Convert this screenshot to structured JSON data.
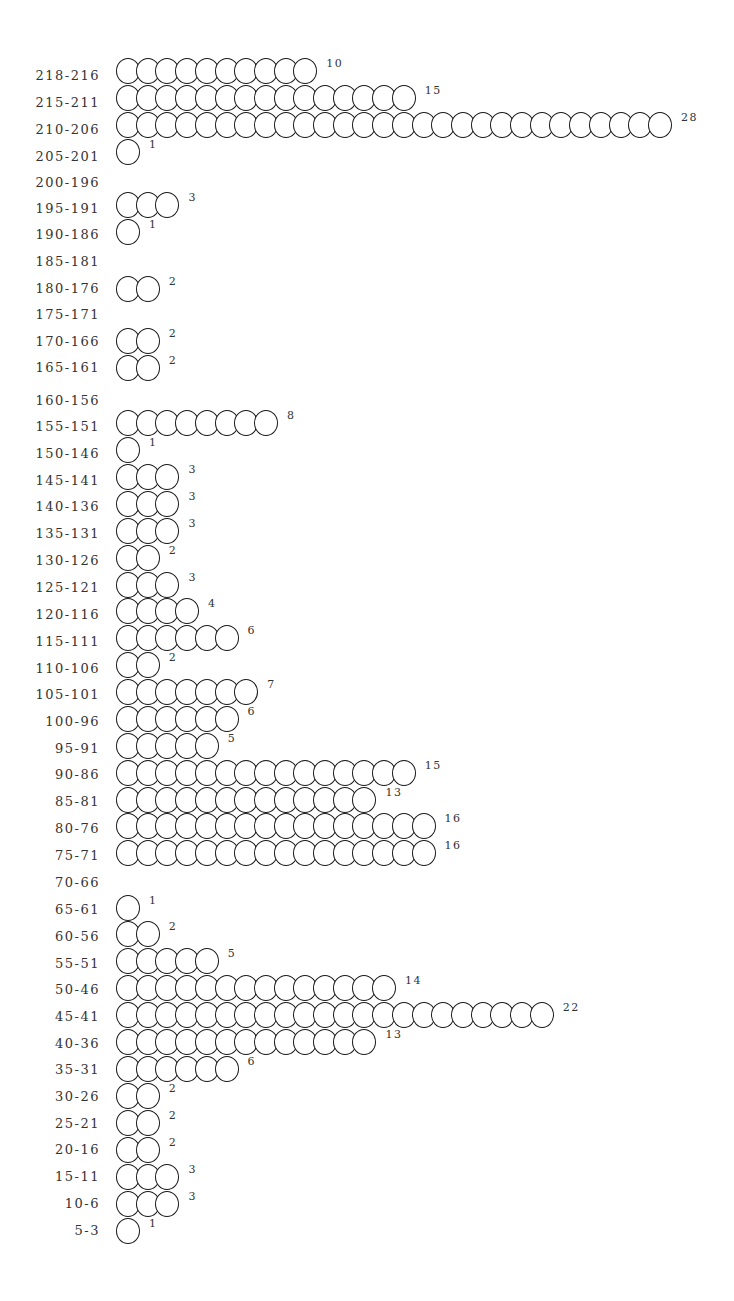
{
  "chart_data": {
    "type": "bar",
    "subtype": "pictogram-histogram",
    "title": "",
    "xlabel": "",
    "ylabel": "",
    "orientation": "horizontal",
    "marker": "circle",
    "categories": [
      "218-216",
      "215-211",
      "210-206",
      "205-201",
      "200-196",
      "195-191",
      "190-186",
      "185-181",
      "180-176",
      "175-171",
      "170-166",
      "165-161",
      "160-156",
      "155-151",
      "150-146",
      "145-141",
      "140-136",
      "135-131",
      "130-126",
      "125-121",
      "120-116",
      "115-111",
      "110-106",
      "105-101",
      "100-96",
      "95-91",
      "90-86",
      "85-81",
      "80-76",
      "75-71",
      "70-66",
      "65-61",
      "60-56",
      "55-51",
      "50-46",
      "45-41",
      "40-36",
      "35-31",
      "30-26",
      "25-21",
      "20-16",
      "15-11",
      "10-6",
      "5-3"
    ],
    "values": [
      10,
      15,
      28,
      1,
      0,
      3,
      1,
      0,
      2,
      0,
      2,
      2,
      0,
      8,
      1,
      3,
      3,
      3,
      2,
      3,
      4,
      6,
      2,
      7,
      6,
      5,
      15,
      13,
      16,
      16,
      0,
      1,
      2,
      5,
      14,
      22,
      13,
      6,
      2,
      2,
      2,
      3,
      3,
      1
    ],
    "value_labels_shown": true,
    "grid": false,
    "legend": null
  },
  "layout": {
    "label_y": [
      79,
      106,
      133,
      160,
      186,
      212,
      238,
      265,
      292,
      318,
      345,
      371,
      404,
      430,
      457,
      484,
      510,
      537,
      564,
      591,
      618,
      645,
      672,
      698,
      725,
      752,
      778,
      805,
      832,
      859,
      886,
      913,
      940,
      967,
      993,
      1020,
      1047,
      1073,
      1100,
      1127,
      1153,
      1180,
      1207,
      1234
    ],
    "circle_cy": [
      70,
      97,
      124,
      151,
      null,
      204,
      231,
      null,
      288,
      null,
      340,
      367,
      null,
      422,
      449,
      476,
      503,
      530,
      557,
      584,
      610,
      637,
      664,
      691,
      718,
      745,
      772,
      799,
      825,
      852,
      null,
      907,
      933,
      960,
      987,
      1014,
      1041,
      1068,
      1095,
      1122,
      1149,
      1176,
      1203,
      1230
    ]
  }
}
